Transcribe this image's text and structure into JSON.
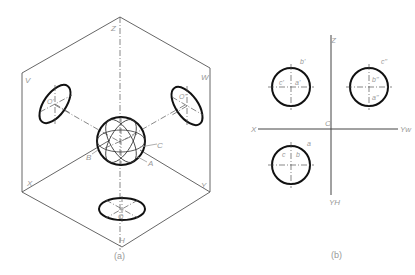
{
  "figure_a": {
    "caption": "(a)",
    "plane_labels": {
      "top": "Z",
      "v_plane": "V",
      "w_plane": "W",
      "x_axis": "X",
      "y_axis": "Y",
      "h_plane": "H"
    },
    "front_ellipse_label": "O'",
    "side_ellipse_label": "O''",
    "bottom_ellipse_label": "O",
    "sphere_labels": {
      "a": "A",
      "b": "B",
      "c": "C"
    }
  },
  "figure_b": {
    "caption": "(b)",
    "axis_labels": {
      "z": "Z",
      "x": "X",
      "yw": "Yw",
      "yh": "YH",
      "origin": "O"
    },
    "front_view_labels": {
      "b": "b'",
      "c": "c'",
      "a": "a'"
    },
    "side_view_labels": {
      "c": "c''",
      "b": "b''",
      "a": "a''"
    },
    "top_view_labels": {
      "a": "a",
      "c": "c",
      "b": "b"
    }
  },
  "colors": {
    "outline": "#111111",
    "frame": "#555555",
    "label": "#999999"
  }
}
